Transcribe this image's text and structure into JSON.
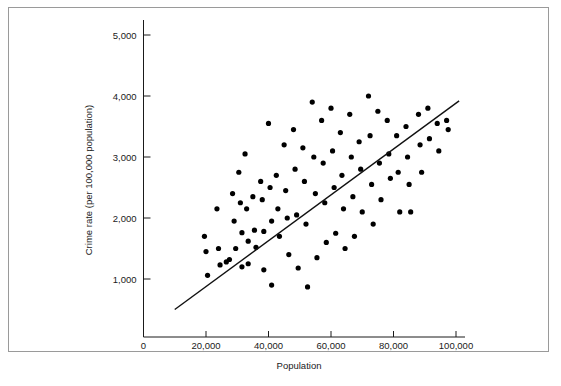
{
  "chart_data": {
    "type": "scatter",
    "title": "",
    "xlabel": "Population",
    "ylabel": "Crime rate (per 100,000 population)",
    "xlim": [
      0,
      108000
    ],
    "ylim": [
      0,
      5400
    ],
    "grid": false,
    "legend": null,
    "xticks": [
      0,
      20000,
      40000,
      60000,
      80000,
      100000
    ],
    "xtick_labels": [
      "0",
      "20,000",
      "40,000",
      "60,000",
      "80,000",
      "100,000"
    ],
    "yticks": [
      1000,
      2000,
      3000,
      4000,
      5000
    ],
    "ytick_labels": [
      "1,000",
      "2,000",
      "3,000",
      "4,000",
      "5,000"
    ],
    "series": [
      {
        "name": "cities",
        "marker": "circle",
        "color": "#000000",
        "points": [
          [
            19500,
            1700
          ],
          [
            20000,
            1450
          ],
          [
            20500,
            1060
          ],
          [
            23500,
            2150
          ],
          [
            24000,
            1500
          ],
          [
            24500,
            1230
          ],
          [
            26500,
            1280
          ],
          [
            27500,
            1320
          ],
          [
            28500,
            2400
          ],
          [
            29000,
            1950
          ],
          [
            29500,
            1500
          ],
          [
            30500,
            2750
          ],
          [
            31000,
            2250
          ],
          [
            31500,
            1760
          ],
          [
            31500,
            1200
          ],
          [
            32500,
            3050
          ],
          [
            33000,
            2150
          ],
          [
            33500,
            1620
          ],
          [
            33500,
            1250
          ],
          [
            35000,
            2350
          ],
          [
            35500,
            1800
          ],
          [
            36000,
            1520
          ],
          [
            37500,
            2600
          ],
          [
            38000,
            2300
          ],
          [
            38500,
            1780
          ],
          [
            38500,
            1150
          ],
          [
            40000,
            3550
          ],
          [
            40500,
            2500
          ],
          [
            41000,
            1950
          ],
          [
            41000,
            900
          ],
          [
            42500,
            2700
          ],
          [
            43000,
            2150
          ],
          [
            43500,
            1700
          ],
          [
            45000,
            3200
          ],
          [
            45500,
            2450
          ],
          [
            46000,
            2000
          ],
          [
            46500,
            1400
          ],
          [
            48000,
            3450
          ],
          [
            48500,
            2800
          ],
          [
            49000,
            2050
          ],
          [
            49500,
            1180
          ],
          [
            51000,
            3150
          ],
          [
            51500,
            2600
          ],
          [
            52000,
            1900
          ],
          [
            52500,
            870
          ],
          [
            54000,
            3900
          ],
          [
            54500,
            3000
          ],
          [
            55000,
            2400
          ],
          [
            55500,
            1350
          ],
          [
            57000,
            3600
          ],
          [
            57500,
            2900
          ],
          [
            58000,
            2250
          ],
          [
            58500,
            1600
          ],
          [
            60000,
            3800
          ],
          [
            60500,
            3100
          ],
          [
            61000,
            2500
          ],
          [
            61500,
            1750
          ],
          [
            63000,
            3400
          ],
          [
            63500,
            2700
          ],
          [
            64000,
            2150
          ],
          [
            64500,
            1500
          ],
          [
            66000,
            3700
          ],
          [
            66500,
            3000
          ],
          [
            67000,
            2350
          ],
          [
            67500,
            1700
          ],
          [
            69000,
            3250
          ],
          [
            69500,
            2800
          ],
          [
            70000,
            2100
          ],
          [
            72000,
            4000
          ],
          [
            72500,
            3350
          ],
          [
            73000,
            2550
          ],
          [
            73500,
            1900
          ],
          [
            75000,
            3750
          ],
          [
            75500,
            2900
          ],
          [
            76000,
            2300
          ],
          [
            78000,
            3600
          ],
          [
            78500,
            3050
          ],
          [
            79000,
            2650
          ],
          [
            81000,
            3350
          ],
          [
            81500,
            2750
          ],
          [
            82000,
            2100
          ],
          [
            84000,
            3500
          ],
          [
            84500,
            3000
          ],
          [
            85000,
            2550
          ],
          [
            85500,
            2100
          ],
          [
            88000,
            3700
          ],
          [
            88500,
            3200
          ],
          [
            89000,
            2750
          ],
          [
            91000,
            3800
          ],
          [
            91500,
            3300
          ],
          [
            94000,
            3550
          ],
          [
            94500,
            3100
          ],
          [
            97000,
            3600
          ],
          [
            97500,
            3450
          ]
        ]
      }
    ],
    "trendline": {
      "name": "regression-line",
      "color": "#111111",
      "x_start": 10000,
      "y_start": 500,
      "x_end": 101000,
      "y_end": 3920
    }
  }
}
